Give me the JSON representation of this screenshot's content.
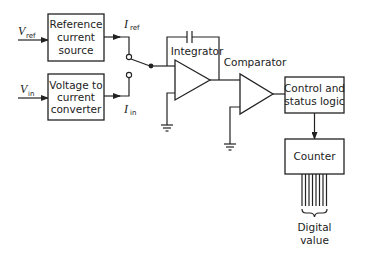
{
  "diagram": {
    "type": "block-diagram",
    "inputs": {
      "vref": {
        "symbol": "V",
        "sub": "ref"
      },
      "vin": {
        "symbol": "V",
        "sub": "in"
      }
    },
    "currents": {
      "iref": {
        "symbol": "I",
        "sub": "ref"
      },
      "iin": {
        "symbol": "I",
        "sub": "in"
      }
    },
    "blocks": {
      "reference": {
        "lines": [
          "Reference",
          "current",
          "source"
        ]
      },
      "v2i": {
        "lines": [
          "Voltage to",
          "current",
          "converter"
        ]
      },
      "control": {
        "lines": [
          "Control and",
          "status logic"
        ]
      },
      "counter": {
        "lines": [
          "Counter"
        ]
      }
    },
    "labels": {
      "integrator": "Integrator",
      "comparator": "Comparator",
      "digital_value": [
        "Digital",
        "value"
      ]
    },
    "output_bits": 8
  }
}
